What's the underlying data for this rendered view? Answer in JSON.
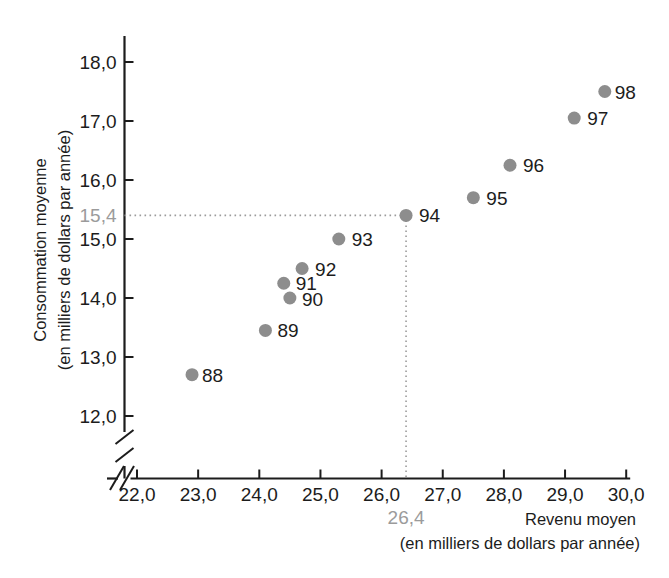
{
  "chart_data": {
    "type": "scatter",
    "title": "",
    "xlabel": "Revenu moyen",
    "xlabel_sub": "(en milliers de dollars par année)",
    "ylabel": "Consommation moyenne",
    "ylabel_sub": "(en milliers de dollars par année)",
    "xlim": [
      22.0,
      30.0
    ],
    "ylim": [
      11.6,
      18.4
    ],
    "grid": false,
    "legend": "none",
    "axis_break_x": true,
    "axis_break_y": true,
    "x_ticks": [
      "22,0",
      "23,0",
      "24,0",
      "25,0",
      "26,0",
      "27,0",
      "28,0",
      "29,0",
      "30,0"
    ],
    "x_tick_values": [
      22.0,
      23.0,
      24.0,
      25.0,
      26.0,
      27.0,
      28.0,
      29.0,
      30.0
    ],
    "y_ticks": [
      "12,0",
      "13,0",
      "14,0",
      "15,0",
      "16,0",
      "17,0",
      "18,0"
    ],
    "y_tick_values": [
      12.0,
      13.0,
      14.0,
      15.0,
      16.0,
      17.0,
      18.0
    ],
    "highlight": {
      "x_label": "26,4",
      "y_label": "15,4",
      "x_value": 26.4,
      "y_value": 15.4,
      "color": "#9b9b9b",
      "point_label": "94"
    },
    "point_color": "#8d8d8d",
    "labels": [
      "88",
      "89",
      "90",
      "91",
      "92",
      "93",
      "94",
      "95",
      "96",
      "97",
      "98"
    ],
    "x": [
      22.9,
      24.1,
      24.5,
      24.4,
      24.7,
      25.3,
      26.4,
      27.5,
      28.1,
      29.15,
      29.65
    ],
    "y": [
      12.7,
      13.45,
      14.0,
      14.25,
      14.5,
      15.0,
      15.4,
      15.7,
      16.25,
      17.05,
      17.5
    ],
    "points": [
      {
        "label": "88",
        "x": 22.9,
        "y": 12.7,
        "label_dx": 10,
        "label_dy": 7
      },
      {
        "label": "89",
        "x": 24.1,
        "y": 13.45,
        "label_dx": 12,
        "label_dy": 7
      },
      {
        "label": "90",
        "x": 24.5,
        "y": 14.0,
        "label_dx": 12,
        "label_dy": 8
      },
      {
        "label": "91",
        "x": 24.4,
        "y": 14.25,
        "label_dx": 12,
        "label_dy": 7
      },
      {
        "label": "92",
        "x": 24.7,
        "y": 14.5,
        "label_dx": 13,
        "label_dy": 7
      },
      {
        "label": "93",
        "x": 25.3,
        "y": 15.0,
        "label_dx": 13,
        "label_dy": 7
      },
      {
        "label": "94",
        "x": 26.4,
        "y": 15.4,
        "label_dx": 13,
        "label_dy": 7
      },
      {
        "label": "95",
        "x": 27.5,
        "y": 15.7,
        "label_dx": 13,
        "label_dy": 7
      },
      {
        "label": "96",
        "x": 28.1,
        "y": 16.25,
        "label_dx": 13,
        "label_dy": 7
      },
      {
        "label": "97",
        "x": 29.15,
        "y": 17.05,
        "label_dx": 13,
        "label_dy": 7
      },
      {
        "label": "98",
        "x": 29.65,
        "y": 17.5,
        "label_dx": 10,
        "label_dy": 7
      }
    ]
  }
}
